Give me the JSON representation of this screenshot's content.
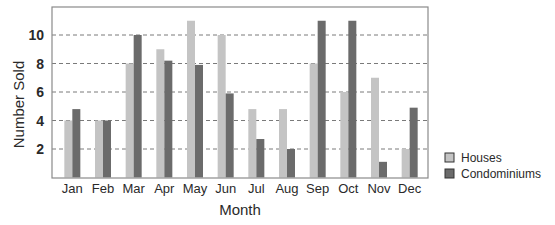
{
  "chart_data": {
    "type": "bar",
    "title": "",
    "xlabel": "Month",
    "ylabel": "Number Sold",
    "categories": [
      "Jan",
      "Feb",
      "Mar",
      "Apr",
      "May",
      "Jun",
      "Jul",
      "Aug",
      "Sep",
      "Oct",
      "Nov",
      "Dec"
    ],
    "series": [
      {
        "name": "Houses",
        "color": "#c4c4c4",
        "values": [
          4,
          4,
          8,
          9,
          11,
          10,
          4.8,
          4.8,
          8,
          6,
          7,
          2
        ]
      },
      {
        "name": "Condominiums",
        "color": "#6b6b6b",
        "values": [
          4.8,
          4,
          10,
          8.2,
          7.9,
          5.9,
          2.7,
          2,
          11,
          11,
          1.1,
          4.9
        ]
      }
    ],
    "yticks": [
      2,
      4,
      6,
      8,
      10
    ],
    "ylim": [
      0,
      12
    ],
    "grid": "horizontal dashed",
    "legend_position": "right"
  },
  "plot": {
    "left": 52,
    "top": 7,
    "right": 428,
    "bottom": 178
  }
}
